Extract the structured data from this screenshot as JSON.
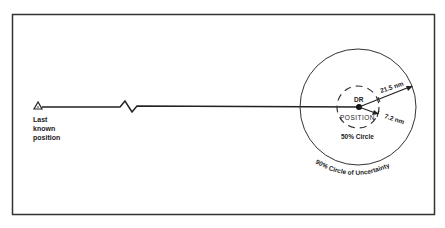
{
  "diagram": {
    "start_label": [
      "Last",
      "known",
      "position"
    ],
    "dr_label": "DR",
    "position_label": "POSITION",
    "radius_outer_label": "21.5 nm",
    "radius_inner_label": "7.2 nm",
    "inner_circle_label": "50% Circle",
    "outer_circle_label": "90% Circle of Uncertainty",
    "colors": {
      "ink": "#222222",
      "background": "#ffffff"
    }
  }
}
